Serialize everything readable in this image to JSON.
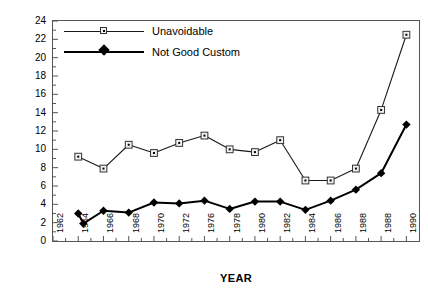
{
  "chart_data": {
    "type": "line",
    "title": "",
    "xlabel": "YEAR",
    "ylabel": "PERCENTAGE",
    "xlim": [
      1962,
      1991
    ],
    "ylim": [
      0,
      24
    ],
    "yticks": [
      0,
      2,
      4,
      6,
      8,
      10,
      12,
      14,
      16,
      18,
      20,
      22,
      24
    ],
    "xtick_labels": [
      "1962",
      "1964",
      "1966",
      "1968",
      "1970",
      "1972",
      "1976",
      "1978",
      "1980",
      "1982",
      "1984",
      "1986",
      "1988",
      "1988",
      "1990"
    ],
    "xtick_years": [
      1962,
      1964,
      1966,
      1968,
      1970,
      1972,
      1974,
      1976,
      1978,
      1980,
      1982,
      1984,
      1986,
      1988,
      1990
    ],
    "grid": false,
    "minor_ticks": true,
    "legend_position": "top-left",
    "series": [
      {
        "name": "Unavoidable",
        "marker": "open-square",
        "line_width": "thin",
        "x": [
          1964,
          1966,
          1968,
          1970,
          1972,
          1974,
          1976,
          1978,
          1980,
          1982,
          1984,
          1986,
          1988,
          1990
        ],
        "values": [
          9.2,
          7.9,
          10.5,
          9.6,
          10.7,
          11.5,
          10.0,
          9.7,
          11.0,
          6.6,
          6.6,
          7.9,
          14.3,
          22.5
        ]
      },
      {
        "name": "Not Good Custom",
        "marker": "filled-diamond",
        "line_width": "thick",
        "x": [
          1964,
          1964.4,
          1966,
          1968,
          1970,
          1972,
          1974,
          1976,
          1978,
          1980,
          1982,
          1984,
          1986,
          1988,
          1990
        ],
        "values": [
          3.0,
          1.9,
          3.3,
          3.1,
          4.2,
          4.1,
          4.4,
          3.5,
          4.3,
          4.3,
          3.4,
          4.4,
          5.6,
          7.4,
          12.7
        ]
      }
    ]
  },
  "colors": {
    "axis": "#555555",
    "series_unavoidable": "#1a1a1a",
    "series_not_good_custom": "#000000",
    "background": "#ffffff"
  }
}
